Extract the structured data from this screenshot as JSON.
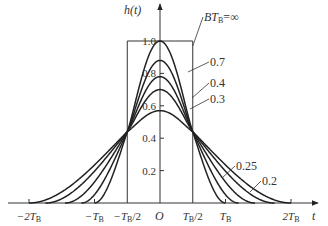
{
  "chart_data": {
    "type": "line",
    "title": "",
    "xlabel": "t",
    "ylabel": "h(t)",
    "origin_label": "O",
    "x_ticks": [
      {
        "label": "−2T",
        "sub": "B",
        "value": -2
      },
      {
        "label": "−T",
        "sub": "B",
        "value": -1
      },
      {
        "label": "−T",
        "sub": "B",
        "tail": "/2",
        "value": -0.5
      },
      {
        "label": "T",
        "sub": "B",
        "tail": "/2",
        "value": 0.5
      },
      {
        "label": "T",
        "sub": "B",
        "value": 1
      },
      {
        "label": "2T",
        "sub": "B",
        "value": 2
      }
    ],
    "y_ticks": [
      {
        "label": "0.2",
        "value": 0.2
      },
      {
        "label": "0.4",
        "value": 0.4
      },
      {
        "label": "0.6",
        "value": 0.6
      },
      {
        "label": "0.8",
        "value": 0.8
      },
      {
        "label": "1.0",
        "value": 1.0
      }
    ],
    "xlim": [
      -2.1,
      2.3
    ],
    "ylim": [
      0,
      1.1
    ],
    "grid": false,
    "units": "x in units of T_B",
    "series": [
      {
        "name": "BT_B=∞",
        "label": "BT",
        "label_sub": "B",
        "label_tail": "=∞",
        "shape": "rectangle",
        "peak": 1.0,
        "width": 1.0
      },
      {
        "name": "0.7",
        "label": "0.7",
        "peak": 1.0,
        "zero_at": 1.0
      },
      {
        "name": "0.4",
        "label": "0.4",
        "peak": 0.88,
        "zero_at": 1.2
      },
      {
        "name": "0.3",
        "label": "0.3",
        "peak": 0.78,
        "zero_at": 1.45
      },
      {
        "name": "0.25",
        "label": "0.25",
        "peak": 0.7,
        "zero_at": 1.75
      },
      {
        "name": "0.2",
        "label": "0.2",
        "peak": 0.57,
        "zero_at": 2.0
      }
    ],
    "crossing_point": {
      "t": 0.5,
      "h": 0.44
    }
  }
}
